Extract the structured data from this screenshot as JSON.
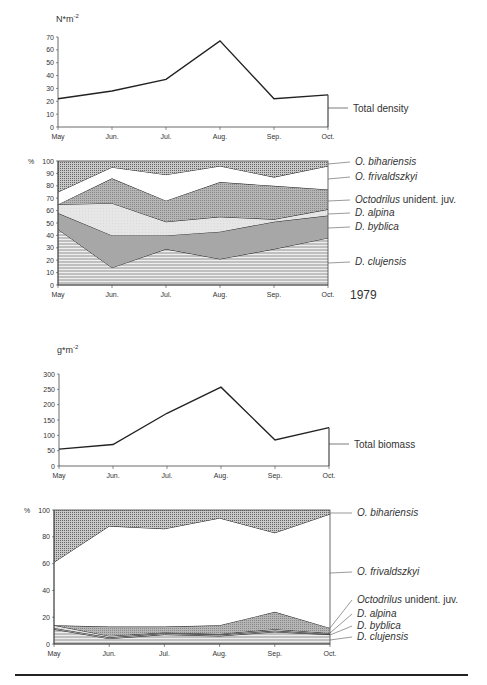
{
  "chart_data": [
    {
      "type": "line",
      "title": "",
      "unit_label": "N*m-2",
      "categories": [
        "May",
        "Jun.",
        "Jul.",
        "Aug.",
        "Sep.",
        "Oct."
      ],
      "series": [
        {
          "name": "Total density",
          "values": [
            22,
            28,
            37,
            67,
            22,
            25
          ]
        }
      ],
      "ylim": [
        0,
        70
      ],
      "yticks": [
        0,
        10,
        20,
        30,
        40,
        50,
        60,
        70
      ],
      "grid": false
    },
    {
      "type": "area",
      "stacked": true,
      "percent": true,
      "unit_label": "%",
      "annotation": "1979",
      "categories": [
        "May",
        "Jun.",
        "Jul.",
        "Aug.",
        "Sep.",
        "Oct."
      ],
      "series": [
        {
          "name": "D. clujensis",
          "values": [
            45,
            14,
            29,
            21,
            29,
            38
          ]
        },
        {
          "name": "D. byblica",
          "values": [
            13,
            26,
            11,
            22,
            22,
            18
          ]
        },
        {
          "name": "D. alpina",
          "values": [
            7,
            26,
            11,
            12,
            2,
            5
          ]
        },
        {
          "name": "Octodrilus unident. juv.",
          "values": [
            0,
            20,
            17,
            28,
            27,
            16
          ]
        },
        {
          "name": "O. frivaldszkyi",
          "values": [
            10,
            9,
            21,
            13,
            7,
            19
          ]
        },
        {
          "name": "O. bihariensis",
          "values": [
            25,
            5,
            11,
            4,
            13,
            4
          ]
        }
      ],
      "ylim": [
        0,
        100
      ],
      "yticks": [
        0,
        10,
        20,
        30,
        40,
        50,
        60,
        70,
        80,
        90,
        100
      ]
    },
    {
      "type": "line",
      "unit_label": "g*m-2",
      "categories": [
        "May",
        "Jun.",
        "Jul.",
        "Aug.",
        "Sep.",
        "Oct."
      ],
      "series": [
        {
          "name": "Total biomass",
          "values": [
            55,
            70,
            172,
            257,
            85,
            125
          ]
        }
      ],
      "ylim": [
        0,
        300
      ],
      "yticks": [
        0,
        50,
        100,
        150,
        200,
        250,
        300
      ],
      "grid": false
    },
    {
      "type": "area",
      "stacked": true,
      "percent": true,
      "unit_label": "%",
      "categories": [
        "May",
        "Jun.",
        "Jul.",
        "Aug.",
        "Sep.",
        "Oct."
      ],
      "series": [
        {
          "name": "D. clujensis",
          "values": [
            11,
            4,
            7,
            6,
            9,
            7
          ]
        },
        {
          "name": "D. byblica",
          "values": [
            1,
            1,
            1,
            1,
            1,
            0.5
          ]
        },
        {
          "name": "D. alpina",
          "values": [
            2,
            1,
            0.5,
            0.5,
            1,
            0.5
          ]
        },
        {
          "name": "Octodrilus unident. juv.",
          "values": [
            0,
            7,
            4.5,
            6.5,
            13,
            4
          ]
        },
        {
          "name": "O. frivaldszkyi",
          "values": [
            47,
            75,
            73,
            80,
            59,
            85
          ]
        },
        {
          "name": "O. bihariensis",
          "values": [
            39,
            12,
            14,
            6,
            17,
            3
          ]
        }
      ],
      "ylim": [
        0,
        100
      ],
      "yticks": [
        0,
        20,
        40,
        60,
        80,
        100
      ]
    }
  ],
  "labels": {
    "c1_unit_base": "N*m",
    "c1_unit_exp": "-2",
    "c1_series": "Total density",
    "c2_unit": "%",
    "c2_year": "1979",
    "c3_unit_base": "g*m",
    "c3_unit_exp": "-2",
    "c3_series": "Total biomass",
    "c4_unit": "%",
    "legend": {
      "bihariensis": "O. bihariensis",
      "frivaldszkyi": "O. frivaldszkyi",
      "octodrilus_italic": "Octodrilus",
      "octodrilus_rest": " unident. juv.",
      "alpina": "D. alpina",
      "byblica": "D. byblica",
      "clujensis": "D. clujensis"
    },
    "months": [
      "May",
      "Jun.",
      "Jul.",
      "Aug.",
      "Sep.",
      "Oct."
    ]
  }
}
